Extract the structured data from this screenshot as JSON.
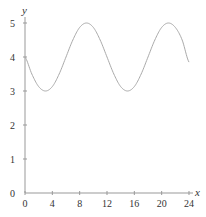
{
  "chart_data": {
    "type": "line",
    "title": "",
    "xlabel": "x",
    "ylabel": "y",
    "xlim": [
      0,
      24
    ],
    "ylim": [
      0,
      5
    ],
    "xticks": [
      "0",
      "4",
      "8",
      "12",
      "16",
      "20",
      "24"
    ],
    "yticks": [
      "0",
      "1",
      "2",
      "3",
      "4",
      "5"
    ],
    "grid": false,
    "legend": null,
    "series": [
      {
        "name": "y = 4 - sin(πx/6)",
        "x": [
          0,
          1,
          2,
          3,
          4,
          5,
          6,
          7,
          8,
          9,
          10,
          11,
          12,
          13,
          14,
          15,
          16,
          17,
          18,
          19,
          20,
          21,
          22,
          23,
          24
        ],
        "values": [
          4.0,
          3.5,
          3.13,
          3.0,
          3.13,
          3.5,
          4.0,
          4.5,
          4.87,
          5.0,
          4.87,
          4.5,
          4.0,
          3.5,
          3.13,
          3.0,
          3.13,
          3.5,
          4.0,
          4.5,
          4.87,
          5.0,
          4.87,
          4.5,
          3.85
        ]
      }
    ],
    "colors": {
      "line": "#aaaaaa",
      "axis": "#999999",
      "text": "#333333"
    }
  }
}
